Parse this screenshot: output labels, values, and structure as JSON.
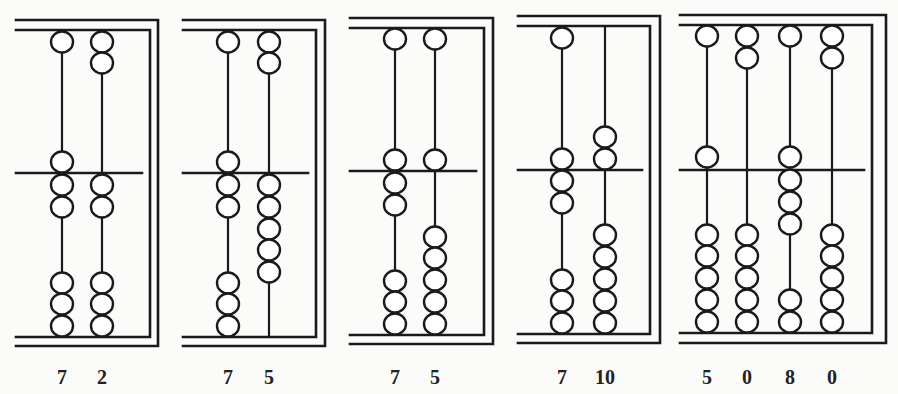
{
  "figure": {
    "stroke_color": "#1a1a1a",
    "background": "#fbfbf9"
  },
  "abaci": [
    {
      "id": "abacus-1",
      "frame": {
        "left": 16,
        "outer_right": 158,
        "inner_right": 150,
        "outer_top": 20,
        "inner_top": 30,
        "beam": 173,
        "inner_bottom": 337,
        "outer_bottom": 346
      },
      "columns": [
        {
          "x": 62,
          "label": "7",
          "upper_beads": [
            42,
            162
          ],
          "lower_beads": [
            185,
            207,
            283,
            304,
            326
          ]
        },
        {
          "x": 102,
          "label": "2",
          "upper_beads": [
            42,
            63
          ],
          "lower_beads": [
            185,
            207,
            283,
            304,
            326
          ]
        }
      ]
    },
    {
      "id": "abacus-2",
      "frame": {
        "left": 183,
        "outer_right": 325,
        "inner_right": 316,
        "outer_top": 20,
        "inner_top": 30,
        "beam": 173,
        "inner_bottom": 337,
        "outer_bottom": 346
      },
      "columns": [
        {
          "x": 228,
          "label": "7",
          "upper_beads": [
            42,
            162
          ],
          "lower_beads": [
            185,
            207,
            283,
            304,
            326
          ]
        },
        {
          "x": 269,
          "label": "5",
          "upper_beads": [
            42,
            63
          ],
          "lower_beads": [
            185,
            207,
            229,
            250,
            272
          ]
        }
      ]
    },
    {
      "id": "abacus-3",
      "frame": {
        "left": 350,
        "outer_right": 493,
        "inner_right": 484,
        "outer_top": 18,
        "inner_top": 28,
        "beam": 171,
        "inner_bottom": 335,
        "outer_bottom": 344
      },
      "columns": [
        {
          "x": 395,
          "label": "7",
          "upper_beads": [
            39,
            160
          ],
          "lower_beads": [
            183,
            205,
            281,
            302,
            324
          ]
        },
        {
          "x": 435,
          "label": "5",
          "upper_beads": [
            39,
            160
          ],
          "lower_beads": [
            237,
            258,
            280,
            302,
            324
          ]
        }
      ]
    },
    {
      "id": "abacus-4",
      "frame": {
        "left": 518,
        "outer_right": 660,
        "inner_right": 650,
        "outer_top": 16,
        "inner_top": 26,
        "beam": 170,
        "inner_bottom": 334,
        "outer_bottom": 343
      },
      "columns": [
        {
          "x": 562,
          "label": "7",
          "upper_beads": [
            38,
            159
          ],
          "lower_beads": [
            181,
            203,
            280,
            301,
            323
          ]
        },
        {
          "x": 605,
          "label": "10",
          "upper_beads": [
            137,
            159
          ],
          "lower_beads": [
            235,
            257,
            279,
            301,
            323
          ]
        }
      ]
    },
    {
      "id": "abacus-5",
      "frame": {
        "left": 680,
        "outer_right": 886,
        "inner_right": 872,
        "outer_top": 15,
        "inner_top": 25,
        "beam": 170,
        "inner_bottom": 333,
        "outer_bottom": 343
      },
      "columns": [
        {
          "x": 707,
          "label": "5",
          "upper_beads": [
            36,
            157
          ],
          "lower_beads": [
            235,
            256,
            278,
            300,
            322
          ]
        },
        {
          "x": 747,
          "label": "0",
          "upper_beads": [
            36,
            58
          ],
          "lower_beads": [
            235,
            256,
            278,
            300,
            322
          ]
        },
        {
          "x": 790,
          "label": "8",
          "upper_beads": [
            36,
            157
          ],
          "lower_beads": [
            180,
            202,
            224,
            300,
            322
          ]
        },
        {
          "x": 832,
          "label": "0",
          "upper_beads": [
            36,
            58
          ],
          "lower_beads": [
            235,
            256,
            278,
            300,
            322
          ]
        }
      ]
    }
  ],
  "labels": {
    "abacus_1": [
      "7",
      "2"
    ],
    "abacus_2": [
      "7",
      "5"
    ],
    "abacus_3": [
      "7",
      "5"
    ],
    "abacus_4": [
      "7",
      "10"
    ],
    "abacus_5": [
      "5",
      "0",
      "8",
      "0"
    ]
  }
}
